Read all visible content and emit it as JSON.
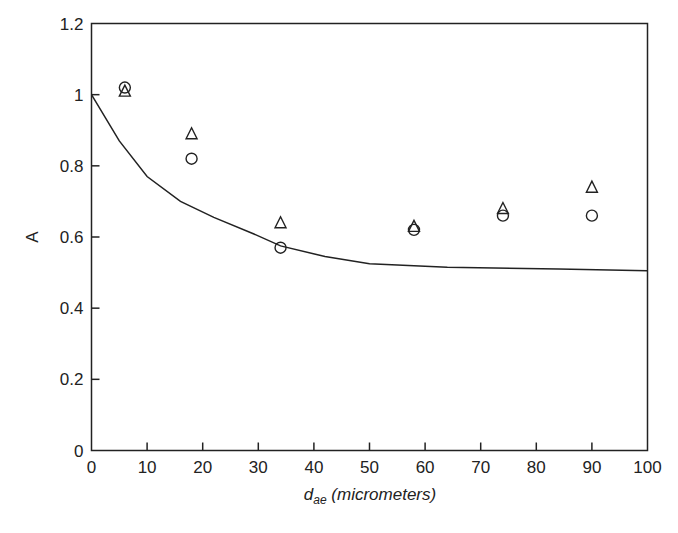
{
  "chart_data": {
    "type": "scatter",
    "title": "",
    "xlabel": "d_ae (micrometers)",
    "xlabel_main": "d",
    "xlabel_sub": "ae",
    "xlabel_unit": " (micrometers)",
    "ylabel": "A",
    "xlim": [
      0,
      100
    ],
    "ylim": [
      0,
      1.2
    ],
    "x_ticks": [
      0,
      10,
      20,
      30,
      40,
      50,
      60,
      70,
      80,
      90,
      100
    ],
    "x_tick_labels": [
      "0",
      "10",
      "20",
      "30",
      "40",
      "50",
      "60",
      "70",
      "80",
      "90",
      "100"
    ],
    "y_ticks": [
      0,
      0.2,
      0.4,
      0.6,
      0.8,
      1.0,
      1.2
    ],
    "y_tick_labels": [
      "0",
      "0.2",
      "0.4",
      "0.6",
      "0.8",
      "1",
      "1.2"
    ],
    "grid": false,
    "legend": null,
    "series": [
      {
        "name": "triangles",
        "marker": "triangle-open",
        "x": [
          6,
          18,
          34,
          58,
          74,
          90
        ],
        "y": [
          1.01,
          0.89,
          0.64,
          0.63,
          0.68,
          0.74
        ]
      },
      {
        "name": "circles",
        "marker": "circle-open",
        "x": [
          6,
          18,
          34,
          58,
          74,
          90
        ],
        "y": [
          1.02,
          0.82,
          0.57,
          0.62,
          0.66,
          0.66
        ]
      },
      {
        "name": "curve",
        "type": "line",
        "x": [
          0,
          5,
          10,
          16,
          22,
          29,
          34,
          42,
          50,
          64,
          84,
          100
        ],
        "y": [
          1.0,
          0.87,
          0.77,
          0.7,
          0.655,
          0.61,
          0.575,
          0.545,
          0.525,
          0.515,
          0.51,
          0.505
        ]
      }
    ],
    "colors": {
      "ink": "#222222",
      "background": "#ffffff"
    }
  }
}
